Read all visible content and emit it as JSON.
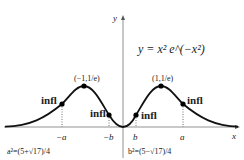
{
  "figure": {
    "equation": "y = x² e^(−x²)",
    "axis_x_label": "x",
    "axis_y_label": "y",
    "points": [
      {
        "label": "(−1,1/e)",
        "kind": "max"
      },
      {
        "label": "(1,1/e)",
        "kind": "max"
      },
      {
        "label": "infl",
        "kind": "inflection",
        "at": "−a"
      },
      {
        "label": "infl",
        "kind": "inflection",
        "at": "−b"
      },
      {
        "label": "infl",
        "kind": "inflection",
        "at": "b"
      },
      {
        "label": "infl",
        "kind": "inflection",
        "at": "a"
      }
    ],
    "ticks": [
      "−a",
      "−b",
      "b",
      "a"
    ],
    "notes": {
      "a_def": "a²=(5+√17)/4",
      "b_def": "b²=(5−√17)/4"
    }
  }
}
